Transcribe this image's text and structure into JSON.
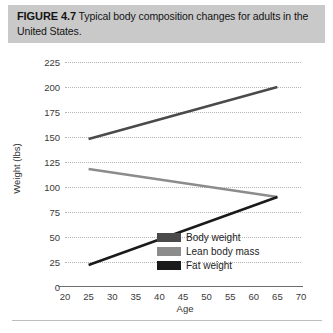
{
  "caption": {
    "label": "FIGURE 4.7",
    "text": "Typical body composition changes for adults in the United States."
  },
  "chart_data": {
    "type": "line",
    "title": "Typical body composition changes for adults in the United States.",
    "xlabel": "Age",
    "ylabel": "Weight (lbs)",
    "xlim": [
      20,
      70
    ],
    "ylim": [
      0,
      225
    ],
    "xticks": [
      20,
      25,
      30,
      35,
      40,
      45,
      50,
      55,
      60,
      65,
      70
    ],
    "yticks": [
      0,
      25,
      50,
      75,
      100,
      125,
      150,
      175,
      200,
      225
    ],
    "grid": "horizontal-dotted",
    "legend_position": "inside-lower-right",
    "x": [
      25,
      65
    ],
    "series": [
      {
        "name": "Body weight",
        "values": [
          148,
          200
        ],
        "color": "#4a4a4a"
      },
      {
        "name": "Lean body mass",
        "values": [
          118,
          90
        ],
        "color": "#8c8c8c"
      },
      {
        "name": "Fat weight",
        "values": [
          22,
          90
        ],
        "color": "#1a1a1a"
      }
    ]
  }
}
